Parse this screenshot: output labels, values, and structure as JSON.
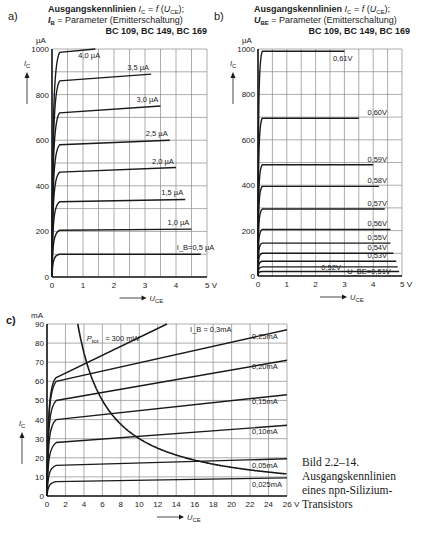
{
  "caption": {
    "line1": "Bild 2.2–14.",
    "line2": "Ausgangskennlinien",
    "line3": "eines npn-Silizium-",
    "line4": "Transistors"
  },
  "chart_data": [
    {
      "id": "a",
      "type": "line",
      "panel_label": "a)",
      "title": "Ausgangskennlinien I_C = f (U_CE);",
      "subtitle": "I_B = Parameter (Emitterschaltung)",
      "devices": "BC 109, BC 149, BC 169",
      "xlabel": "U_CE",
      "ylabel": "I_C",
      "y_unit": "µA",
      "x_unit": "V",
      "xlim": [
        0,
        5
      ],
      "ylim": [
        0,
        1000
      ],
      "xticks": [
        0,
        1,
        2,
        3,
        4,
        5
      ],
      "yticks": [
        0,
        200,
        400,
        600,
        800,
        1000
      ],
      "grid": {
        "x_step": 0.5,
        "y_step": 100
      },
      "series": [
        {
          "name": "I_B = 0,5 µA",
          "label": "I_B=0,5 µA",
          "knee": 100,
          "end_x": 4.8,
          "end_y": 100
        },
        {
          "name": "1,0 µA",
          "label": "1,0 µA",
          "knee": 205,
          "end_x": 4.5,
          "end_y": 210
        },
        {
          "name": "1,5 µA",
          "label": "1,5 µA",
          "knee": 330,
          "end_x": 4.3,
          "end_y": 340
        },
        {
          "name": "2,0 µA",
          "label": "2,0 µA",
          "knee": 460,
          "end_x": 4.0,
          "end_y": 480
        },
        {
          "name": "2,5 µA",
          "label": "2,5 µA",
          "knee": 580,
          "end_x": 3.8,
          "end_y": 600
        },
        {
          "name": "3,0 µA",
          "label": "3,0 µA",
          "knee": 720,
          "end_x": 3.5,
          "end_y": 750
        },
        {
          "name": "3,5 µA",
          "label": "3,5 µA",
          "knee": 860,
          "end_x": 3.2,
          "end_y": 890
        },
        {
          "name": "4,0 µA",
          "label": "4,0 µA",
          "knee": 985,
          "end_x": 1.4,
          "end_y": 1000
        }
      ]
    },
    {
      "id": "b",
      "type": "line",
      "panel_label": "b)",
      "title": "Ausgangskennlinien I_C = f (U_CE);",
      "subtitle": "U_BE = Parameter (Emitterschaltung)",
      "devices": "BC 109, BC 149, BC 169",
      "xlabel": "U_CE",
      "ylabel": "I_C",
      "y_unit": "µA",
      "x_unit": "V",
      "xlim": [
        0,
        5
      ],
      "ylim": [
        0,
        1000
      ],
      "xticks": [
        0,
        1,
        2,
        3,
        4,
        5
      ],
      "yticks": [
        0,
        200,
        400,
        600,
        800,
        1000
      ],
      "grid": {
        "x_step": 0.5,
        "y_step": 100
      },
      "series": [
        {
          "name": "U_BE = 0,51 V",
          "label": "U_BE=0,51V",
          "value": 20,
          "end_x": 4.9
        },
        {
          "name": "0,52 V",
          "label": "0,52V",
          "value": 40,
          "end_x": 4.85
        },
        {
          "name": "0,53 V",
          "label": "0,53V",
          "value": 65,
          "end_x": 4.8
        },
        {
          "name": "0,54 V",
          "label": "0,54V",
          "value": 100,
          "end_x": 4.7
        },
        {
          "name": "0,55 V",
          "label": "0,55V",
          "value": 145,
          "end_x": 4.6
        },
        {
          "name": "0,56 V",
          "label": "0,56V",
          "value": 205,
          "end_x": 4.6
        },
        {
          "name": "0,57 V",
          "label": "0,57V",
          "value": 295,
          "end_x": 4.4
        },
        {
          "name": "0,58 V",
          "label": "0,58V",
          "value": 395,
          "end_x": 4.2
        },
        {
          "name": "0,59 V",
          "label": "0,59V",
          "value": 490,
          "end_x": 4.0
        },
        {
          "name": "0,60 V",
          "label": "0,60V",
          "value": 695,
          "end_x": 3.5
        },
        {
          "name": "0,61 V",
          "label": "0,61V",
          "value": 990,
          "end_x": 3.0
        }
      ]
    },
    {
      "id": "c",
      "type": "line",
      "panel_label": "c)",
      "xlabel": "U_CE",
      "ylabel": "I_C",
      "y_unit": "mA",
      "x_unit": "V",
      "xlim": [
        0,
        26
      ],
      "ylim": [
        0,
        90
      ],
      "xticks": [
        0,
        2,
        4,
        6,
        8,
        10,
        12,
        14,
        16,
        18,
        20,
        22,
        24,
        26
      ],
      "yticks": [
        0,
        10,
        20,
        30,
        40,
        50,
        60,
        70,
        80,
        90
      ],
      "grid": {
        "x_step": 2,
        "y_step": 10
      },
      "series": [
        {
          "name": "0,025 mA",
          "label": "0,025mA",
          "knee": 7,
          "start_y": 7.5,
          "end_y": 9.5
        },
        {
          "name": "0,05 mA",
          "label": "0,05mA",
          "knee": 15,
          "start_y": 16,
          "end_y": 19.5
        },
        {
          "name": "0,10 mA",
          "label": "0,10mA",
          "knee": 26,
          "start_y": 28,
          "end_y": 37
        },
        {
          "name": "0,15 mA",
          "label": "0,15mA",
          "knee": 38,
          "start_y": 40,
          "end_y": 53
        },
        {
          "name": "0,20 mA",
          "label": "0,20mA",
          "knee": 48,
          "start_y": 50,
          "end_y": 71
        },
        {
          "name": "0,25 mA",
          "label": "0,25mA",
          "knee": 57,
          "start_y": 60,
          "end_y": 87
        },
        {
          "name": "I_B = 0,3 mA",
          "label": "I_B = 0,3mA",
          "knee": 60,
          "start_y": 62,
          "end_y": 90,
          "end_x": 13
        }
      ],
      "hyperbola": {
        "name": "P_tot = 300 mW",
        "label": "P_tot = 300 mW",
        "power_mW": 300
      }
    }
  ]
}
